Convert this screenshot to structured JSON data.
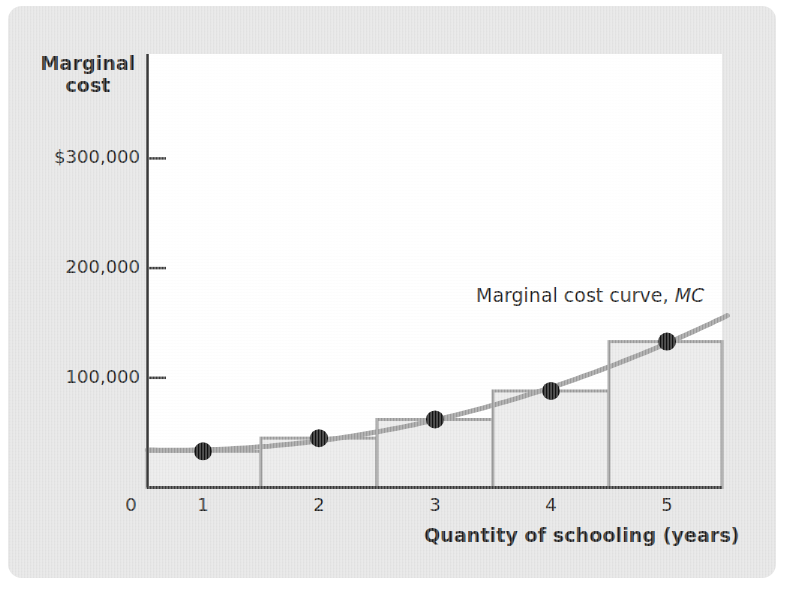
{
  "figure": {
    "y_axis_title": "Marginal\ncost",
    "y_axis_title_line1": "Marginal",
    "y_axis_title_line2": "cost",
    "x_axis_title": "Quantity of schooling (years)",
    "curve_label_text": "Marginal cost curve, ",
    "curve_label_symbol": "MC"
  },
  "colors": {
    "panel_background": "#e3e3e3",
    "plot_background": "#ffffff",
    "axis_line": "#3a3a3a",
    "curve": "#9a9a9a",
    "bar_stroke": "#9a9a9a",
    "bar_fill": "#e8e8e8",
    "point": "#111111",
    "text": "#1b1b1b"
  },
  "chart_data": {
    "type": "bar",
    "title": "",
    "subtitle": "",
    "xlabel": "Quantity of schooling (years)",
    "ylabel": "Marginal cost",
    "categories": [
      "1",
      "2",
      "3",
      "4",
      "5"
    ],
    "x": [
      1,
      2,
      3,
      4,
      5
    ],
    "values": [
      33000,
      45000,
      62000,
      88000,
      133000
    ],
    "series": [
      {
        "name": "Marginal cost curve, MC",
        "type": "line",
        "values": [
          33000,
          45000,
          62000,
          88000,
          133000
        ]
      }
    ],
    "bar_style": "step-bars centered on each integer, width 1 year",
    "markers": "filled black circles at each (quantity, marginal cost) point",
    "xlim": [
      0,
      5.5
    ],
    "ylim": [
      0,
      340000
    ],
    "x_ticks": [
      "0",
      "1",
      "2",
      "3",
      "4",
      "5"
    ],
    "x_tick_values": [
      0,
      1,
      2,
      3,
      4,
      5
    ],
    "y_ticks": [
      "$300,000",
      "200,000",
      "100,000"
    ],
    "y_tick_values": [
      300000,
      200000,
      100000
    ],
    "grid": false,
    "legend": "inline annotation",
    "annotations": [
      {
        "text": "Marginal cost curve, MC",
        "x": 4.4,
        "y": 185000
      }
    ]
  },
  "y_axis": {
    "ticks": [
      {
        "label": "$300,000",
        "value": 300000
      },
      {
        "label": "200,000",
        "value": 200000
      },
      {
        "label": "100,000",
        "value": 100000
      }
    ]
  },
  "x_axis": {
    "ticks": [
      {
        "label": "0",
        "value": 0
      },
      {
        "label": "1",
        "value": 1
      },
      {
        "label": "2",
        "value": 2
      },
      {
        "label": "3",
        "value": 3
      },
      {
        "label": "4",
        "value": 4
      },
      {
        "label": "5",
        "value": 5
      }
    ]
  }
}
